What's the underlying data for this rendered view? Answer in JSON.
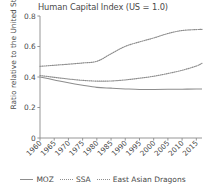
{
  "chart_data": {
    "type": "line",
    "title": "Human Capital Index (US = 1.0)",
    "xlabel": "",
    "ylabel": "Ratio relative to the United States",
    "xlim": [
      1960,
      2017
    ],
    "ylim": [
      0,
      0.8
    ],
    "grid": false,
    "legend_position": "bottom",
    "yticks": [
      "0",
      "0.2",
      "0.4",
      "0.6",
      "0.8"
    ],
    "ytick_values": [
      0,
      0.2,
      0.4,
      0.6,
      0.8
    ],
    "xticks": [
      "1960",
      "1965",
      "1970",
      "1975",
      "1980",
      "1985",
      "1990",
      "1995",
      "2000",
      "2005",
      "2010",
      "2015"
    ],
    "x": [
      1960,
      1965,
      1970,
      1975,
      1980,
      1985,
      1990,
      1995,
      2000,
      2005,
      2010,
      2015,
      2017
    ],
    "series": [
      {
        "name": "MOZ",
        "style": "solid",
        "color": "#8d8d8d",
        "values": [
          0.4,
          0.381,
          0.362,
          0.346,
          0.332,
          0.327,
          0.322,
          0.318,
          0.318,
          0.319,
          0.32,
          0.321,
          0.321
        ]
      },
      {
        "name": "SSA",
        "style": "dotted",
        "color": "#8d8d8d",
        "values": [
          0.41,
          0.398,
          0.387,
          0.378,
          0.373,
          0.374,
          0.381,
          0.392,
          0.405,
          0.423,
          0.444,
          0.472,
          0.49
        ]
      },
      {
        "name": "East Asian Dragons",
        "style": "dotted",
        "color": "#8d8d8d",
        "values": [
          0.47,
          0.477,
          0.484,
          0.492,
          0.503,
          0.552,
          0.601,
          0.63,
          0.656,
          0.685,
          0.705,
          0.711,
          0.712
        ]
      }
    ]
  }
}
